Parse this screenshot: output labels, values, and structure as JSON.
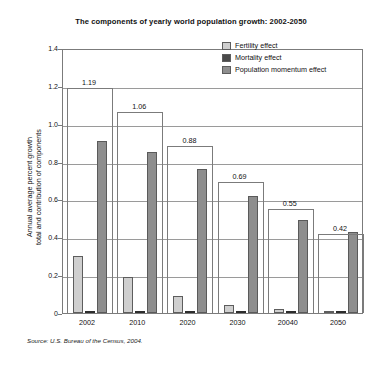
{
  "chart_data": {
    "type": "bar",
    "title": "The components of yearly world population growth: 2002-2050",
    "xlabel": "",
    "ylabel_line1": "Annual average percent growth",
    "ylabel_line2": "total and contribution of components",
    "ylim": [
      0,
      1.4
    ],
    "yticks": [
      "0",
      "0.2",
      "0.4",
      "0.6",
      "0.8",
      "1.0",
      "1.2",
      "1.4"
    ],
    "ytick_values": [
      0,
      0.2,
      0.4,
      0.6,
      0.8,
      1.0,
      1.2,
      1.4
    ],
    "grid": true,
    "legend_position": "top-right",
    "categories": [
      "2002",
      "2010",
      "2020",
      "2030",
      "20040",
      "2050"
    ],
    "series": [
      {
        "name": "Fertility effect",
        "color": "#cfcfcf",
        "values": [
          0.3,
          0.19,
          0.09,
          0.04,
          0.02,
          0.0
        ]
      },
      {
        "name": "Mortality effect",
        "color": "#4a4a4a",
        "values": [
          0.01,
          0.01,
          0.01,
          0.01,
          0.01,
          0.01
        ]
      },
      {
        "name": "Population momentum effect",
        "color": "#8e8e8e",
        "values": [
          0.91,
          0.85,
          0.76,
          0.62,
          0.49,
          0.43
        ]
      }
    ],
    "totals": [
      1.19,
      1.06,
      0.88,
      0.69,
      0.55,
      0.42
    ],
    "total_labels": [
      "1.19",
      "1.06",
      "0.88",
      "0.69",
      "0.55",
      "0.42"
    ],
    "source": "Source: U.S. Bureau of the Census, 2004."
  }
}
